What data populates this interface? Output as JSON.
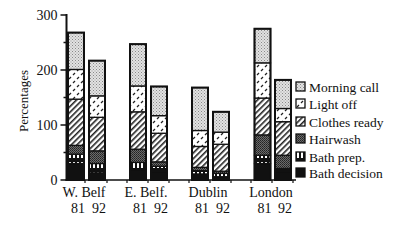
{
  "chart_data": {
    "type": "bar",
    "stacked": true,
    "title": "",
    "xlabel": "",
    "ylabel": "Percentages",
    "ylim": [
      0,
      300
    ],
    "yticks": [
      0,
      100,
      200,
      300
    ],
    "grid": false,
    "legend_position": "right",
    "groups": [
      {
        "label": "W. Belf",
        "years": [
          "81",
          "92"
        ]
      },
      {
        "label": "E. Belf.",
        "years": [
          "81",
          "92"
        ]
      },
      {
        "label": "Dublin",
        "years": [
          "81",
          "92"
        ]
      },
      {
        "label": "London",
        "years": [
          "81",
          "92"
        ]
      }
    ],
    "categories": [
      "W. Belf 81",
      "W. Belf 92",
      "E. Belf. 81",
      "E. Belf. 92",
      "Dublin 81",
      "Dublin 92",
      "London 81",
      "London 92"
    ],
    "series": [
      {
        "name": "Bath decision",
        "pattern": "solid-black",
        "values": [
          30,
          13,
          19,
          15,
          11,
          6,
          30,
          15
        ]
      },
      {
        "name": "Bath prep.",
        "pattern": "vertical-bars",
        "values": [
          17,
          17,
          13,
          10,
          6,
          6,
          15,
          6
        ]
      },
      {
        "name": "Hairwash",
        "pattern": "dark-dots",
        "values": [
          16,
          23,
          24,
          8,
          6,
          4,
          37,
          24
        ]
      },
      {
        "name": "Clothes ready",
        "pattern": "diagonal-hatch",
        "values": [
          84,
          61,
          68,
          52,
          38,
          49,
          67,
          61
        ]
      },
      {
        "name": "Light off",
        "pattern": "white-dashes",
        "values": [
          54,
          39,
          47,
          32,
          29,
          22,
          64,
          24
        ]
      },
      {
        "name": "Morning call",
        "pattern": "light-dots",
        "values": [
          67,
          64,
          76,
          53,
          78,
          37,
          62,
          52
        ]
      }
    ],
    "totals": [
      268,
      217,
      253,
      170,
      168,
      124,
      275,
      182
    ]
  },
  "legend": {
    "items": [
      {
        "label": "Morning call",
        "pattern": "light-dots"
      },
      {
        "label": "Light off",
        "pattern": "white-dashes"
      },
      {
        "label": "Clothes ready",
        "pattern": "diagonal-hatch"
      },
      {
        "label": "Hairwash",
        "pattern": "dark-dots"
      },
      {
        "label": "Bath prep.",
        "pattern": "vertical-bars"
      },
      {
        "label": "Bath decision",
        "pattern": "solid-black"
      }
    ]
  },
  "colors": {
    "ink": "#111111",
    "background": "#ffffff",
    "light_dots": "#c8c8c8",
    "dark_dots": "#555555"
  }
}
